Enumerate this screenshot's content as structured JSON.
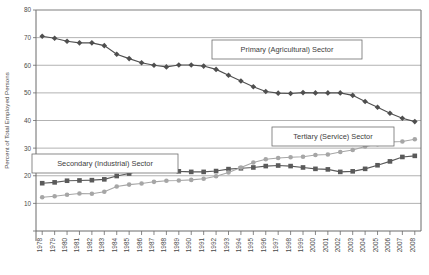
{
  "chart_data": {
    "type": "line",
    "title": "",
    "xlabel": "",
    "ylabel": "Percent of Total Employed Persons",
    "ylim": [
      0,
      80
    ],
    "yticks": [
      0,
      10,
      20,
      30,
      40,
      50,
      60,
      70,
      80
    ],
    "ytick_labels": [
      "",
      "10",
      "20",
      "30",
      "40",
      "50",
      "60",
      "70",
      "80"
    ],
    "grid": true,
    "legend_position": "inline-annotations",
    "categories": [
      "1978",
      "1979",
      "1980",
      "1981",
      "1982",
      "1983",
      "1984",
      "1985",
      "1986",
      "1987",
      "1988",
      "1989",
      "1990",
      "1991",
      "1992",
      "1993",
      "1994",
      "1995",
      "1996",
      "1997",
      "1998",
      "1999",
      "2000",
      "2001",
      "2002",
      "2003",
      "2004",
      "2005",
      "2006",
      "2007",
      "2008"
    ],
    "series": [
      {
        "name": "Primary (Agricultural) Sector",
        "color": "#4f4f4f",
        "marker": "diamond",
        "values": [
          70.5,
          69.8,
          68.7,
          68.1,
          68.1,
          67.1,
          64.0,
          62.4,
          60.9,
          60.0,
          59.4,
          60.1,
          60.1,
          59.7,
          58.5,
          56.4,
          54.3,
          52.2,
          50.5,
          49.9,
          49.8,
          50.1,
          50.0,
          50.0,
          50.0,
          49.1,
          46.9,
          44.8,
          42.6,
          40.8,
          39.6
        ]
      },
      {
        "name": "Secondary (Industrial) Sector",
        "color": "#5a5a5a",
        "marker": "square",
        "values": [
          17.3,
          17.6,
          18.2,
          18.3,
          18.4,
          18.7,
          19.9,
          20.8,
          21.9,
          22.2,
          22.4,
          21.6,
          21.4,
          21.4,
          21.7,
          22.4,
          22.7,
          23.0,
          23.5,
          23.7,
          23.5,
          23.0,
          22.5,
          22.3,
          21.4,
          21.6,
          22.5,
          23.8,
          25.2,
          26.8,
          27.2
        ]
      },
      {
        "name": "Tertiary (Service) Sector",
        "color": "#a6a6a6",
        "marker": "circle",
        "values": [
          12.2,
          12.6,
          13.1,
          13.6,
          13.5,
          14.2,
          16.1,
          16.8,
          17.2,
          17.8,
          18.2,
          18.3,
          18.5,
          18.9,
          19.8,
          21.2,
          23.0,
          24.8,
          26.0,
          26.4,
          26.7,
          26.9,
          27.5,
          27.7,
          28.6,
          29.3,
          30.6,
          31.4,
          32.2,
          32.4,
          33.2
        ]
      }
    ],
    "annotations": [
      {
        "text": "Primary (Agricultural) Sector",
        "x": 212,
        "y": 40,
        "w": 150,
        "h": 19
      },
      {
        "text": "Tertiary (Service) Sector",
        "x": 272,
        "y": 127,
        "w": 122,
        "h": 19
      },
      {
        "text": "Secondary (Industrial) Sector",
        "x": 32,
        "y": 154,
        "w": 146,
        "h": 19
      }
    ]
  }
}
